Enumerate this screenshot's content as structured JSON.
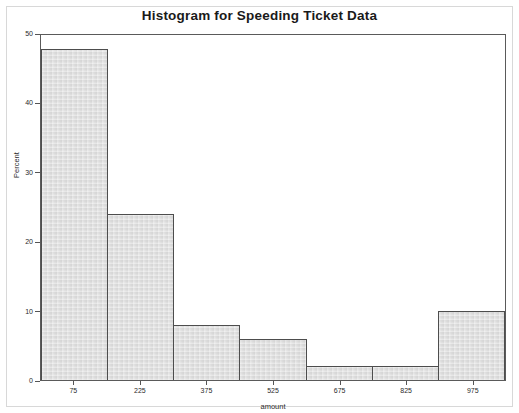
{
  "chart_data": {
    "type": "bar",
    "title": "Histogram for Speeding Ticket Data",
    "xlabel": "amount",
    "ylabel": "Percent",
    "categories": [
      "75",
      "225",
      "375",
      "525",
      "675",
      "825",
      "975"
    ],
    "values": [
      48,
      24,
      8,
      6,
      2,
      2,
      10
    ],
    "ylim": [
      0,
      50
    ],
    "yticks": [
      0,
      10,
      20,
      30,
      40,
      50
    ],
    "ytick_labels": [
      "0",
      "10",
      "20",
      "30",
      "40",
      "50"
    ],
    "xtick_labels": [
      "75",
      "225",
      "375",
      "525",
      "675",
      "825",
      "975"
    ],
    "bin_width": 150,
    "grid": false,
    "legend": null,
    "bar_fill_color": "#dcdcdc",
    "bar_edge_color": "#4d4d4d",
    "frame_color": "#5a5a5a",
    "background_color": "#ffffff"
  }
}
